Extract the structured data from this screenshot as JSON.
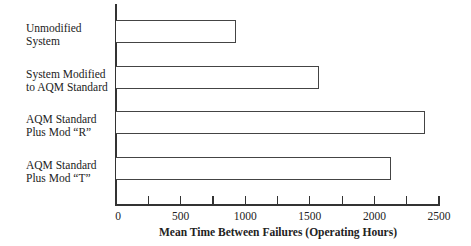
{
  "chart_data": {
    "type": "bar",
    "orientation": "horizontal",
    "title": "",
    "xlabel": "Mean Time Between Failures (Operating Hours)",
    "ylabel": "",
    "categories": [
      "Unmodified System",
      "System Modified to AQM Standard",
      "AQM Standard Plus Mod “R”",
      "AQM Standard Plus Mod “T”"
    ],
    "values": [
      930,
      1570,
      2390,
      2130
    ],
    "xlim": [
      0,
      2500
    ],
    "x_ticks": [
      0,
      500,
      1000,
      1500,
      2000,
      2500
    ],
    "minor_ticks": [
      250,
      750,
      1250,
      1750,
      2250
    ],
    "grid": false,
    "legend": null
  },
  "labels": {
    "cat0": [
      "Unmodified",
      "System"
    ],
    "cat1": [
      "System Modified",
      "to AQM Standard"
    ],
    "cat2": [
      "AQM Standard",
      "Plus Mod “R”"
    ],
    "cat3": [
      "AQM Standard",
      "Plus Mod “T”"
    ]
  },
  "axis": {
    "tick_labels": [
      "0",
      "500",
      "1000",
      "1500",
      "2000",
      "2500"
    ],
    "title": "Mean Time Between Failures (Operating Hours)"
  }
}
